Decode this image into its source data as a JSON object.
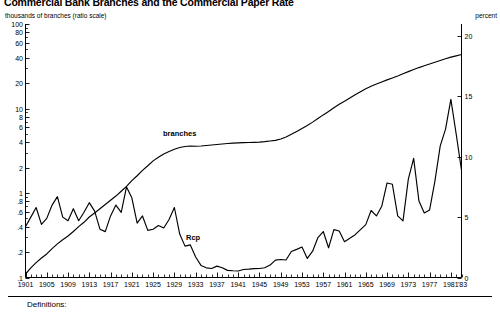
{
  "figure": {
    "title": "Commercial Bank Branches and the Commercial Paper Rate",
    "left_unit_label": "thousands of branches (ratio scale)",
    "right_unit_label": "percent",
    "footnote": "Definitions:"
  },
  "labels": {
    "branches": "branches",
    "rcp": "Rcp"
  },
  "chart_data": {
    "type": "line",
    "title": "Commercial Bank Branches and the Commercial Paper Rate",
    "xlabel": "",
    "ylabel": "thousands of branches (ratio scale)",
    "y2label": "percent",
    "grid": false,
    "legend": "inline-annotations",
    "x_axis": {
      "min": 1901,
      "max": 1983,
      "tick_step": 4,
      "minor_tick_step": 1,
      "tick_labels": [
        "1901",
        "1905",
        "1909",
        "1913",
        "1917",
        "1921",
        "1925",
        "1929",
        "1933",
        "1937",
        "1941",
        "1945",
        "1949",
        "1953",
        "1957",
        "1961",
        "1965",
        "1969",
        "1973",
        "1977",
        "1981",
        "'83"
      ]
    },
    "y_axis_left": {
      "scale": "log",
      "min": 0.1,
      "max": 100,
      "tick_labels": [
        "100",
        "80",
        "60",
        "40",
        "20",
        "10",
        "8",
        "6",
        "4",
        "2",
        "1",
        ".8",
        ".6",
        ".4",
        ".2",
        ".1"
      ],
      "tick_values": [
        100,
        80,
        60,
        40,
        20,
        10,
        8,
        6,
        4,
        2,
        1,
        0.8,
        0.6,
        0.4,
        0.2,
        0.1
      ]
    },
    "y_axis_right": {
      "scale": "linear",
      "min": 0,
      "max": 21,
      "tick_labels": [
        "20",
        "15",
        "10",
        "5",
        "0"
      ],
      "tick_values": [
        20,
        15,
        10,
        5,
        0
      ]
    },
    "series": [
      {
        "name": "branches",
        "axis": "left",
        "units": "thousands of branches",
        "x": [
          1901,
          1902,
          1903,
          1904,
          1905,
          1906,
          1907,
          1908,
          1909,
          1910,
          1911,
          1912,
          1913,
          1914,
          1915,
          1916,
          1917,
          1918,
          1919,
          1920,
          1921,
          1922,
          1923,
          1924,
          1925,
          1926,
          1927,
          1928,
          1929,
          1930,
          1931,
          1932,
          1933,
          1934,
          1935,
          1936,
          1937,
          1938,
          1939,
          1940,
          1941,
          1942,
          1943,
          1944,
          1945,
          1946,
          1947,
          1948,
          1949,
          1950,
          1951,
          1952,
          1953,
          1954,
          1955,
          1956,
          1957,
          1958,
          1959,
          1960,
          1961,
          1962,
          1963,
          1964,
          1965,
          1966,
          1967,
          1968,
          1969,
          1970,
          1971,
          1972,
          1973,
          1974,
          1975,
          1976,
          1977,
          1978,
          1979,
          1980,
          1981,
          1982,
          1983
        ],
        "values": [
          0.11,
          0.13,
          0.15,
          0.17,
          0.19,
          0.22,
          0.25,
          0.28,
          0.31,
          0.35,
          0.4,
          0.45,
          0.52,
          0.58,
          0.65,
          0.73,
          0.82,
          0.92,
          1.05,
          1.2,
          1.4,
          1.6,
          1.85,
          2.1,
          2.4,
          2.65,
          2.9,
          3.1,
          3.3,
          3.45,
          3.55,
          3.6,
          3.58,
          3.6,
          3.65,
          3.7,
          3.75,
          3.8,
          3.85,
          3.9,
          3.92,
          3.94,
          3.96,
          3.98,
          4.0,
          4.05,
          4.12,
          4.2,
          4.35,
          4.6,
          4.95,
          5.35,
          5.8,
          6.3,
          6.9,
          7.6,
          8.4,
          9.2,
          10.2,
          11.2,
          12.2,
          13.3,
          14.5,
          15.8,
          17.1,
          18.3,
          19.5,
          20.6,
          21.8,
          23.0,
          24.3,
          25.8,
          27.3,
          28.9,
          30.5,
          32.0,
          33.6,
          35.2,
          37.0,
          38.8,
          40.5,
          42.0,
          43.5
        ]
      },
      {
        "name": "Rcp",
        "axis": "right",
        "units": "percent, commercial paper rate",
        "x": [
          1901,
          1902,
          1903,
          1904,
          1905,
          1906,
          1907,
          1908,
          1909,
          1910,
          1911,
          1912,
          1913,
          1914,
          1915,
          1916,
          1917,
          1918,
          1919,
          1920,
          1921,
          1922,
          1923,
          1924,
          1925,
          1926,
          1927,
          1928,
          1929,
          1930,
          1931,
          1932,
          1933,
          1934,
          1935,
          1936,
          1937,
          1938,
          1939,
          1940,
          1941,
          1942,
          1943,
          1944,
          1945,
          1946,
          1947,
          1948,
          1949,
          1950,
          1951,
          1952,
          1953,
          1954,
          1955,
          1956,
          1957,
          1958,
          1959,
          1960,
          1961,
          1962,
          1963,
          1964,
          1965,
          1966,
          1967,
          1968,
          1969,
          1970,
          1971,
          1972,
          1973,
          1974,
          1975,
          1976,
          1977,
          1978,
          1979,
          1980,
          1981,
          1982,
          1983
        ],
        "values": [
          4.2,
          5.0,
          5.8,
          4.4,
          4.9,
          6.0,
          6.7,
          5.0,
          4.7,
          5.7,
          4.7,
          5.4,
          6.2,
          5.5,
          4.0,
          3.8,
          5.1,
          6.0,
          5.4,
          7.5,
          6.6,
          4.5,
          5.1,
          3.9,
          4.0,
          4.3,
          4.1,
          4.8,
          5.8,
          3.6,
          2.6,
          2.7,
          1.7,
          1.0,
          0.8,
          0.75,
          0.94,
          0.81,
          0.59,
          0.56,
          0.54,
          0.66,
          0.69,
          0.73,
          0.75,
          0.81,
          1.03,
          1.44,
          1.49,
          1.45,
          2.16,
          2.33,
          2.52,
          1.58,
          2.18,
          3.31,
          3.81,
          2.46,
          3.97,
          3.85,
          2.97,
          3.26,
          3.55,
          3.97,
          4.38,
          5.55,
          5.1,
          5.9,
          7.83,
          7.72,
          5.11,
          4.69,
          8.15,
          9.87,
          6.33,
          5.35,
          5.6,
          7.99,
          10.91,
          12.29,
          14.76,
          11.89,
          8.89
        ]
      }
    ]
  }
}
